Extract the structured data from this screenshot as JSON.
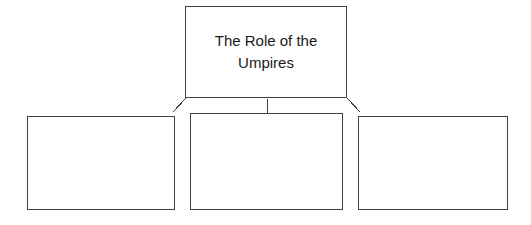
{
  "diagram": {
    "type": "hierarchy-organizer",
    "canvas": {
      "width": 531,
      "height": 225,
      "background_color": "#ffffff"
    },
    "line_color": "#404040",
    "text_color": "#1a1a1a",
    "root": {
      "label": "The Role of the\nUmpires",
      "line_1": "The Role of the",
      "line_2": "Umpires"
    },
    "branches": [
      {
        "label": ""
      },
      {
        "label": ""
      },
      {
        "label": ""
      }
    ],
    "connectors": [
      {
        "name": "root-to-branch-1",
        "style": "elbow-diagonal-left"
      },
      {
        "name": "root-to-branch-2",
        "style": "vertical-stub"
      },
      {
        "name": "root-to-branch-3",
        "style": "elbow-diagonal-right"
      }
    ]
  }
}
